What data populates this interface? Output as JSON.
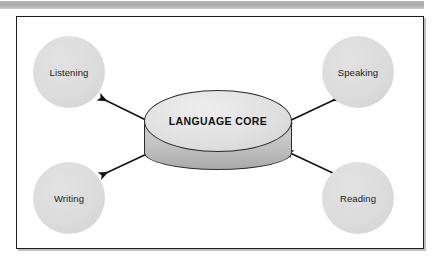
{
  "figure": {
    "type": "hub-and-spoke-diagram",
    "banner": {
      "name": "top-gray-bar"
    },
    "core": {
      "label": "LANGUAGE CORE",
      "shape": "3d-cylinder-ellipse",
      "fill_color": "#e2e2e2",
      "side_color": "#b5b5b5",
      "stroke_color": "#2b2b2b"
    },
    "nodes": [
      {
        "id": "listening",
        "label": "Listening",
        "position": "top-left",
        "shape": "circle",
        "fill_color": "#dcdcdc"
      },
      {
        "id": "speaking",
        "label": "Speaking",
        "position": "top-right",
        "shape": "circle",
        "fill_color": "#dcdcdc"
      },
      {
        "id": "writing",
        "label": "Writing",
        "position": "bottom-left",
        "shape": "circle",
        "fill_color": "#dcdcdc"
      },
      {
        "id": "reading",
        "label": "Reading",
        "position": "bottom-right",
        "shape": "circle",
        "fill_color": "#dcdcdc"
      }
    ],
    "connectors": [
      {
        "from": "listening",
        "to": "core",
        "style": "double-headed-arrow",
        "color": "#111111"
      },
      {
        "from": "speaking",
        "to": "core",
        "style": "double-headed-arrow",
        "color": "#111111"
      },
      {
        "from": "writing",
        "to": "core",
        "style": "double-headed-arrow",
        "color": "#111111"
      },
      {
        "from": "reading",
        "to": "core",
        "style": "double-headed-arrow",
        "color": "#111111"
      }
    ],
    "frame": {
      "border_color": "#1c1c1c",
      "background_color": "#ffffff"
    }
  }
}
